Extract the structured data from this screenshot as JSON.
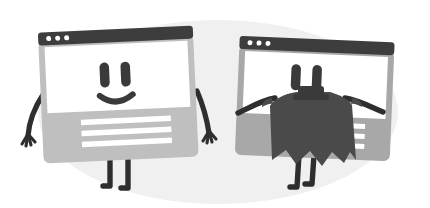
{
  "scene": {
    "title": "Two browser window characters, one wearing a cape",
    "width": 430,
    "height": 208,
    "background_color": "#ffffff",
    "blob_color": "#f0f0f0",
    "alt_text": "Flat illustration of two smiling browser-window characters with stick arms and legs; the right one wears a dark superhero cape."
  },
  "palette": {
    "page_background": "#ffffff",
    "backdrop_blob": "#f0f0f0",
    "titlebar_dark": "#3d3d3d",
    "titlebar_shadow": "#2f2f2f",
    "screen_white": "#ffffff",
    "body_light_gray": "#bfbfbf",
    "body_mid_gray": "#a8a8a8",
    "frame_light": "#c7c7c7",
    "frame_dark": "#9a9a9a",
    "limb_dark": "#2e2e2e",
    "face_dark": "#3a3a3a",
    "cape_dark": "#4a4a4a",
    "content_line": "#ffffff",
    "dot_white": "#ffffff"
  },
  "characters": [
    {
      "id": "left-character",
      "name": "Plain browser character",
      "expression": "smiling",
      "titlebar": {
        "dot_count": 3,
        "dot_color": "#ffffff",
        "bar_color": "#3d3d3d"
      },
      "screen": {
        "fill": "#ffffff",
        "eye_count": 2,
        "mouth": "smile-curve"
      },
      "body": {
        "fill": "#bfbfbf",
        "content_line_count": 3,
        "content_line_color": "#ffffff"
      },
      "limbs": {
        "arm_count": 2,
        "leg_count": 2,
        "color": "#2e2e2e",
        "pose": "arms-hanging-down"
      },
      "cape": null
    },
    {
      "id": "right-character",
      "name": "Caped browser character",
      "expression": "smiling-hidden-by-cape",
      "titlebar": {
        "dot_count": 3,
        "dot_color": "#ffffff",
        "bar_color": "#3d3d3d"
      },
      "screen": {
        "fill": "#ffffff",
        "eye_count": 2,
        "mouth": "hidden-behind-collar"
      },
      "body": {
        "fill": "#a8a8a8",
        "content_line_count": 3,
        "content_line_color": "#ffffff"
      },
      "limbs": {
        "arm_count": 2,
        "leg_count": 2,
        "color": "#2e2e2e",
        "pose": "arms-outstretched-holding-cape"
      },
      "cape": {
        "fill": "#4a4a4a",
        "collar": "knot-at-neck",
        "hem": "jagged-three-points"
      }
    }
  ]
}
